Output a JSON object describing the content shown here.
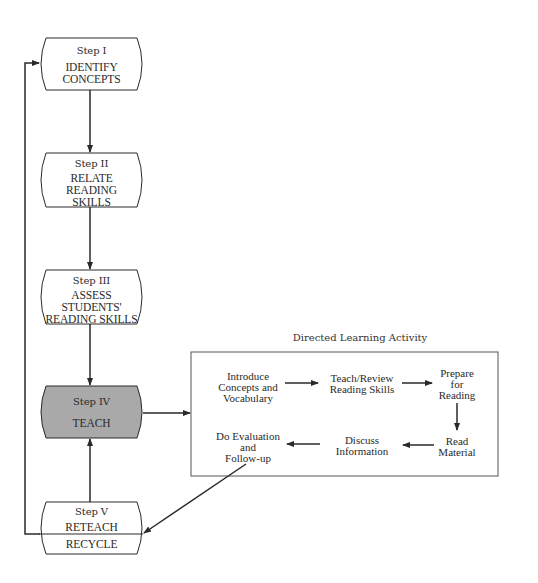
{
  "steps": [
    {
      "id": "step-1",
      "label": "Step I",
      "name_lines": [
        "IDENTIFY",
        "CONCEPTS"
      ],
      "fill": "#ffffff"
    },
    {
      "id": "step-2",
      "label": "Step II",
      "name_lines": [
        "RELATE",
        "READING",
        "SKILLS"
      ],
      "fill": "#ffffff"
    },
    {
      "id": "step-3",
      "label": "Step III",
      "name_lines": [
        "ASSESS",
        "STUDENTS'",
        "READING SKILLS"
      ],
      "fill": "#ffffff"
    },
    {
      "id": "step-4",
      "label": "Step IV",
      "name_lines": [
        "TEACH"
      ],
      "fill": "#a9a9a9"
    },
    {
      "id": "step-5",
      "label": "Step V",
      "name_lines": [
        "RETEACH"
      ],
      "sub_label": "RECYCLE",
      "fill": "#ffffff"
    }
  ],
  "dla": {
    "title": "Directed Learning Activity",
    "nodes": [
      {
        "id": "introduce",
        "lines": [
          "Introduce",
          "Concepts and",
          "Vocabulary"
        ]
      },
      {
        "id": "teach-review",
        "lines": [
          "Teach/Review",
          "Reading Skills"
        ]
      },
      {
        "id": "prepare",
        "lines": [
          "Prepare",
          "for",
          "Reading"
        ]
      },
      {
        "id": "read",
        "lines": [
          "Read",
          "Material"
        ]
      },
      {
        "id": "discuss",
        "lines": [
          "Discuss",
          "Information"
        ]
      },
      {
        "id": "evaluate",
        "lines": [
          "Do Evaluation",
          "and",
          "Follow-up"
        ]
      }
    ]
  },
  "colors": {
    "line": "#2a2a2a",
    "highlight_fill": "#a9a9a9",
    "box_border": "#555555"
  }
}
